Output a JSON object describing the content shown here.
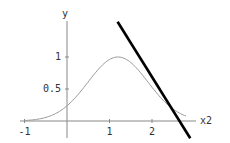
{
  "chart_data": {
    "type": "line",
    "title": "",
    "xlabel": "x2",
    "ylabel": "y",
    "xlim": [
      -1.0,
      2.9
    ],
    "ylim": [
      -0.25,
      1.55
    ],
    "grid": false,
    "legend": null,
    "x_ticks": [
      {
        "value": -1,
        "label": "-1"
      },
      {
        "value": 1,
        "label": "1"
      },
      {
        "value": 2,
        "label": "2"
      }
    ],
    "y_ticks": [
      {
        "value": 0.5,
        "label": "0.5"
      },
      {
        "value": 1,
        "label": "1"
      }
    ],
    "series": [
      {
        "name": "gaussian-curve",
        "style": "thin gray",
        "color": "#999999",
        "function": "exp(-(x2-1.2)^2 / 1.0)",
        "x": [
          -1.0,
          -0.5,
          0.0,
          0.5,
          1.0,
          1.2,
          1.5,
          2.0,
          2.5,
          2.8
        ],
        "y": [
          0.01,
          0.06,
          0.24,
          0.61,
          0.96,
          1.0,
          0.91,
          0.53,
          0.18,
          0.08
        ]
      },
      {
        "name": "tangent-line",
        "style": "thick black",
        "color": "#000000",
        "x": [
          1.19,
          2.9
        ],
        "y": [
          1.55,
          -0.27
        ]
      }
    ]
  },
  "axes": {
    "x_label": "x2",
    "y_label": "y"
  }
}
